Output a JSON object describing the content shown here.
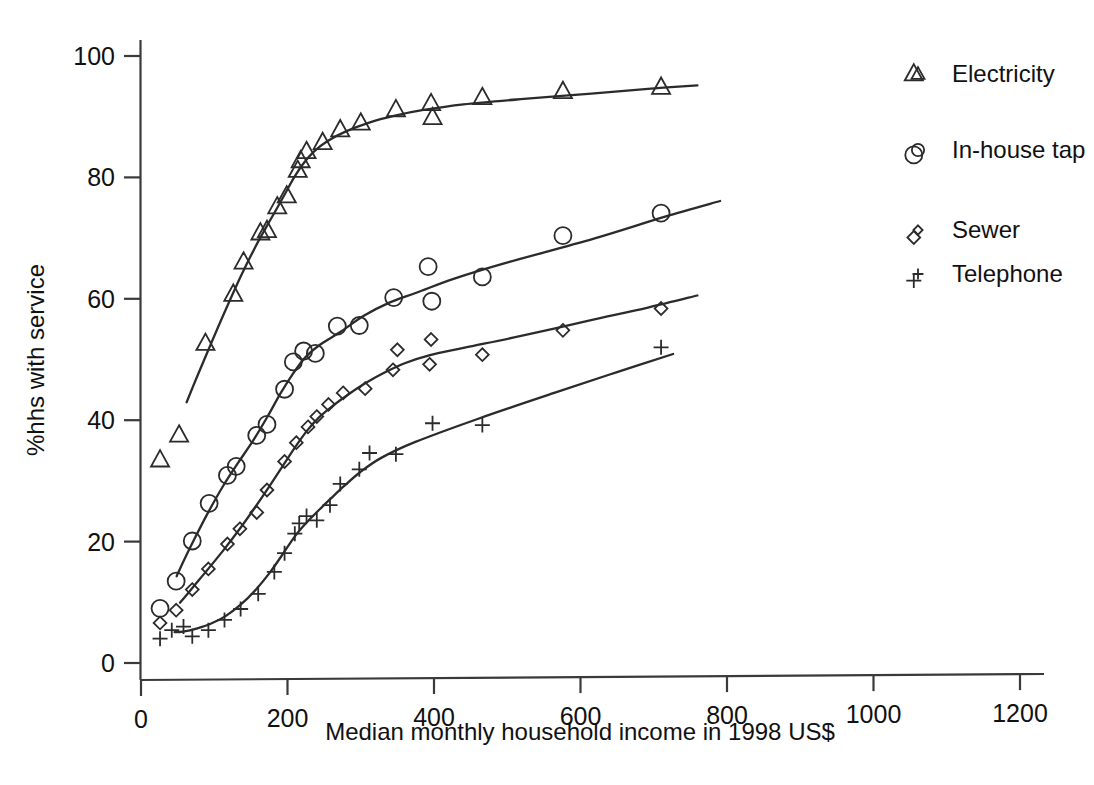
{
  "chart_data": {
    "type": "line",
    "title": "",
    "subtitle": "",
    "xlabel": "Median monthly household income in 1998 US$",
    "ylabel": "%hhs with service",
    "xlim": [
      0,
      1240
    ],
    "ylim": [
      0,
      104
    ],
    "xticks": [
      0,
      200,
      400,
      600,
      800,
      1000,
      1200
    ],
    "xtick_labels": [
      "0",
      "200",
      "400",
      "600",
      "800",
      "1000",
      "1200"
    ],
    "yticks": [
      0,
      20,
      40,
      60,
      80,
      100
    ],
    "ytick_labels": [
      "0",
      "20",
      "40",
      "60",
      "80",
      "100"
    ],
    "grid": false,
    "legend_position": "right-outside",
    "series": [
      {
        "name": "Electricity",
        "marker": "triangle-up",
        "points": [
          {
            "x": 26,
            "y": 33.5
          },
          {
            "x": 52,
            "y": 37.6
          },
          {
            "x": 88,
            "y": 52.7
          },
          {
            "x": 126,
            "y": 60.8
          },
          {
            "x": 140,
            "y": 66.1
          },
          {
            "x": 163,
            "y": 70.9
          },
          {
            "x": 172,
            "y": 71.3
          },
          {
            "x": 186,
            "y": 75.2
          },
          {
            "x": 199,
            "y": 77.0
          },
          {
            "x": 214,
            "y": 81.2
          },
          {
            "x": 218,
            "y": 82.8
          },
          {
            "x": 226,
            "y": 84.3
          },
          {
            "x": 248,
            "y": 85.8
          },
          {
            "x": 272,
            "y": 87.9
          },
          {
            "x": 300,
            "y": 89.0
          },
          {
            "x": 348,
            "y": 91.2
          },
          {
            "x": 396,
            "y": 92.2
          },
          {
            "x": 398,
            "y": 89.9
          },
          {
            "x": 466,
            "y": 93.2
          },
          {
            "x": 576,
            "y": 94.2
          },
          {
            "x": 710,
            "y": 94.9
          },
          {
            "x": 1055,
            "y": 97.1
          }
        ]
      },
      {
        "name": "In-house tap",
        "marker": "circle",
        "points": [
          {
            "x": 26,
            "y": 9.0
          },
          {
            "x": 48,
            "y": 13.5
          },
          {
            "x": 70,
            "y": 20.1
          },
          {
            "x": 93,
            "y": 26.3
          },
          {
            "x": 118,
            "y": 30.9
          },
          {
            "x": 130,
            "y": 32.4
          },
          {
            "x": 158,
            "y": 37.5
          },
          {
            "x": 172,
            "y": 39.3
          },
          {
            "x": 196,
            "y": 45.1
          },
          {
            "x": 208,
            "y": 49.6
          },
          {
            "x": 222,
            "y": 51.4
          },
          {
            "x": 238,
            "y": 51.0
          },
          {
            "x": 268,
            "y": 55.5
          },
          {
            "x": 298,
            "y": 55.6
          },
          {
            "x": 345,
            "y": 60.2
          },
          {
            "x": 392,
            "y": 65.3
          },
          {
            "x": 397,
            "y": 59.6
          },
          {
            "x": 466,
            "y": 63.6
          },
          {
            "x": 576,
            "y": 70.4
          },
          {
            "x": 710,
            "y": 74.1
          },
          {
            "x": 1055,
            "y": 83.7
          }
        ]
      },
      {
        "name": "Sewer",
        "marker": "diamond",
        "points": [
          {
            "x": 26,
            "y": 6.6
          },
          {
            "x": 48,
            "y": 8.7
          },
          {
            "x": 70,
            "y": 12.1
          },
          {
            "x": 92,
            "y": 15.5
          },
          {
            "x": 118,
            "y": 19.6
          },
          {
            "x": 135,
            "y": 22.1
          },
          {
            "x": 158,
            "y": 24.8
          },
          {
            "x": 172,
            "y": 28.5
          },
          {
            "x": 196,
            "y": 33.2
          },
          {
            "x": 212,
            "y": 36.3
          },
          {
            "x": 228,
            "y": 38.9
          },
          {
            "x": 240,
            "y": 40.6
          },
          {
            "x": 256,
            "y": 42.6
          },
          {
            "x": 276,
            "y": 44.5
          },
          {
            "x": 306,
            "y": 45.2
          },
          {
            "x": 344,
            "y": 48.3
          },
          {
            "x": 350,
            "y": 51.6
          },
          {
            "x": 394,
            "y": 49.2
          },
          {
            "x": 396,
            "y": 53.3
          },
          {
            "x": 466,
            "y": 50.8
          },
          {
            "x": 576,
            "y": 54.8
          },
          {
            "x": 710,
            "y": 58.4
          },
          {
            "x": 1055,
            "y": 70.1
          }
        ]
      },
      {
        "name": "Telephone",
        "marker": "plus",
        "points": [
          {
            "x": 26,
            "y": 4.0
          },
          {
            "x": 42,
            "y": 5.4
          },
          {
            "x": 58,
            "y": 6.0
          },
          {
            "x": 70,
            "y": 4.4
          },
          {
            "x": 92,
            "y": 5.4
          },
          {
            "x": 114,
            "y": 7.1
          },
          {
            "x": 136,
            "y": 8.9
          },
          {
            "x": 160,
            "y": 11.4
          },
          {
            "x": 182,
            "y": 15.0
          },
          {
            "x": 196,
            "y": 18.1
          },
          {
            "x": 210,
            "y": 21.3
          },
          {
            "x": 216,
            "y": 23.0
          },
          {
            "x": 226,
            "y": 24.2
          },
          {
            "x": 240,
            "y": 23.5
          },
          {
            "x": 258,
            "y": 26.0
          },
          {
            "x": 272,
            "y": 29.5
          },
          {
            "x": 298,
            "y": 31.9
          },
          {
            "x": 312,
            "y": 34.6
          },
          {
            "x": 348,
            "y": 34.4
          },
          {
            "x": 398,
            "y": 39.5
          },
          {
            "x": 466,
            "y": 39.2
          },
          {
            "x": 710,
            "y": 52.0
          },
          {
            "x": 1055,
            "y": 63.0
          }
        ]
      }
    ]
  },
  "legend": {
    "items": [
      {
        "label": "Electricity",
        "marker": "triangle-up"
      },
      {
        "label": "In-house tap",
        "marker": "circle"
      },
      {
        "label": "Sewer",
        "marker": "diamond"
      },
      {
        "label": "Telephone",
        "marker": "plus"
      }
    ]
  },
  "colors": {
    "line": "#2b2b2b",
    "axis": "#3a3a3a",
    "text": "#111111",
    "background": "#ffffff"
  }
}
